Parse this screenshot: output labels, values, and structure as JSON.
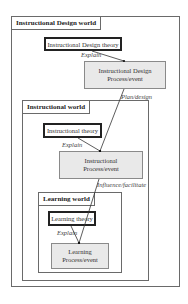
{
  "worlds": {
    "instructional_design": {
      "label": "Instructional Design world",
      "theory": "Instructional Design theory",
      "process_line1": "Instructional Design",
      "process_line2": "Process/event",
      "explain": "Explain"
    },
    "instructional": {
      "label": "Instructional world",
      "theory": "Instructional theory",
      "process_line1": "Instructional",
      "process_line2": "Process/event",
      "explain": "Explain"
    },
    "learning": {
      "label": "Learning world",
      "theory": "Learning theory",
      "process_line1": "Learning",
      "process_line2": "Process/event",
      "explain": "Explain"
    }
  },
  "relations": {
    "plan_design": "Plan/design",
    "influence_facilitate": "Influence/facilitate"
  },
  "colors": {
    "process_fill": "#e9e9e9",
    "border": "#6a6a6a",
    "theory_border": "#222222"
  }
}
